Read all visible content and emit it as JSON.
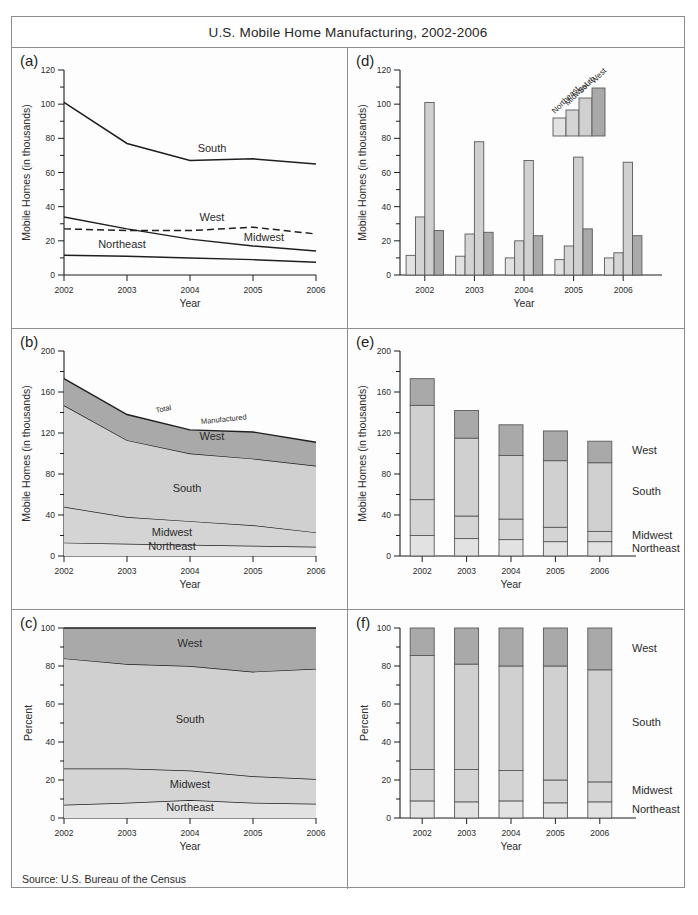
{
  "figure": {
    "title": "U.S. Mobile Home Manufacturing, 2002-2006",
    "source_note": "Source: U.S. Bureau of the Census",
    "panel_tags": [
      "(a)",
      "(d)",
      "(b)",
      "(e)",
      "(c)",
      "(f)"
    ]
  },
  "labels": {
    "year_axis": "Year",
    "homes_axis": "Mobile Homes (in thousands)",
    "percent_axis": "Percent",
    "northeast": "Northeast",
    "midwest": "Midwest",
    "south": "South",
    "west": "West",
    "total": "Total",
    "manufactured": "Manufactured"
  },
  "colors": {
    "northeast": "#e2e2e2",
    "midwest": "#d4d4d4",
    "south": "#d0d0d0",
    "west": "#a9a9a9",
    "line": "#1f1f1f",
    "frame": "#8e8e8e",
    "paper": "#fdfdfd"
  },
  "chart_data": [
    {
      "id": "panel-a",
      "panel": "(a)",
      "type": "line",
      "title": "",
      "xlabel": "Year",
      "ylabel": "Mobile Homes (in thousands)",
      "categories": [
        "2002",
        "2003",
        "2004",
        "2005",
        "2006"
      ],
      "x": [
        2002,
        2003,
        2004,
        2005,
        2006
      ],
      "ylim": [
        0,
        120
      ],
      "yticks": [
        0,
        20,
        40,
        60,
        80,
        100,
        120
      ],
      "minor_ticks": true,
      "grid": false,
      "legend": "inline-labels",
      "series": [
        {
          "name": "South",
          "values": [
            101,
            77,
            67,
            68,
            65
          ],
          "style": "solid"
        },
        {
          "name": "Midwest",
          "values": [
            34,
            27,
            21,
            17,
            14
          ],
          "style": "solid"
        },
        {
          "name": "West",
          "values": [
            27,
            26,
            26,
            28,
            24
          ],
          "style": "dashed"
        },
        {
          "name": "Northeast",
          "values": [
            11.5,
            11,
            10,
            9,
            7.5
          ],
          "style": "solid"
        }
      ]
    },
    {
      "id": "panel-d",
      "panel": "(d)",
      "type": "bar",
      "title": "",
      "xlabel": "Year",
      "ylabel": "Mobile Homes (in thousands)",
      "categories": [
        "2002",
        "2003",
        "2004",
        "2005",
        "2006"
      ],
      "ylim": [
        0,
        120
      ],
      "yticks": [
        0,
        20,
        40,
        60,
        80,
        100,
        120
      ],
      "minor_ticks": true,
      "grid": false,
      "legend": "stepped-icon",
      "legend_entries": [
        "Northeast",
        "Midwest",
        "South",
        "West"
      ],
      "series": [
        {
          "name": "Northeast",
          "values": [
            11.5,
            11,
            10,
            9,
            10
          ]
        },
        {
          "name": "Midwest",
          "values": [
            34,
            24,
            20,
            17,
            13
          ]
        },
        {
          "name": "South",
          "values": [
            101,
            78,
            67,
            69,
            66
          ]
        },
        {
          "name": "West",
          "values": [
            26,
            25,
            23,
            27,
            23
          ]
        }
      ]
    },
    {
      "id": "panel-b",
      "panel": "(b)",
      "type": "area",
      "stacked": true,
      "title": "",
      "xlabel": "Year",
      "ylabel": "Mobile Homes (in thousands)",
      "categories": [
        "2002",
        "2003",
        "2004",
        "2005",
        "2006"
      ],
      "ylim": [
        0,
        200
      ],
      "yticks": [
        0,
        40,
        80,
        120,
        160,
        200
      ],
      "minor_ticks": true,
      "grid": false,
      "annotations": [
        "Total",
        "Manufactured"
      ],
      "series": [
        {
          "name": "Northeast",
          "values": [
            13,
            12,
            11,
            10,
            9
          ]
        },
        {
          "name": "Midwest",
          "values": [
            35,
            26,
            23,
            20,
            14
          ]
        },
        {
          "name": "South",
          "values": [
            99,
            75,
            66,
            65,
            65
          ]
        },
        {
          "name": "West",
          "values": [
            26,
            25,
            23,
            26,
            23
          ]
        }
      ],
      "totals": [
        173,
        138,
        123,
        121,
        111
      ]
    },
    {
      "id": "panel-e",
      "panel": "(e)",
      "type": "bar",
      "stacked": true,
      "title": "",
      "xlabel": "Year",
      "ylabel": "Mobile Homes (in thousands)",
      "categories": [
        "2002",
        "2003",
        "2004",
        "2005",
        "2006"
      ],
      "ylim": [
        0,
        200
      ],
      "yticks": [
        0,
        40,
        80,
        120,
        160,
        200
      ],
      "minor_ticks": true,
      "grid": false,
      "legend": "right-labels",
      "series": [
        {
          "name": "Northeast",
          "values": [
            20,
            17,
            16,
            14,
            14
          ]
        },
        {
          "name": "Midwest",
          "values": [
            35,
            22,
            20,
            14,
            10
          ]
        },
        {
          "name": "South",
          "values": [
            92,
            76,
            62,
            65,
            67
          ]
        },
        {
          "name": "West",
          "values": [
            26,
            27,
            30,
            29,
            21
          ]
        }
      ],
      "totals": [
        173,
        142,
        128,
        122,
        112
      ]
    },
    {
      "id": "panel-c",
      "panel": "(c)",
      "type": "area",
      "stacked": true,
      "normalized": true,
      "title": "",
      "xlabel": "Year",
      "ylabel": "Percent",
      "categories": [
        "2002",
        "2003",
        "2004",
        "2005",
        "2006"
      ],
      "ylim": [
        0,
        100
      ],
      "yticks": [
        0,
        20,
        40,
        60,
        80,
        100
      ],
      "minor_ticks": true,
      "grid": false,
      "series": [
        {
          "name": "Northeast",
          "values": [
            7,
            8,
            9.5,
            8,
            7.5
          ]
        },
        {
          "name": "Midwest",
          "values": [
            19,
            18,
            15.5,
            14,
            13
          ]
        },
        {
          "name": "South",
          "values": [
            58,
            55,
            55,
            55,
            58
          ]
        },
        {
          "name": "West",
          "values": [
            16,
            19,
            20,
            23,
            21.5
          ]
        }
      ]
    },
    {
      "id": "panel-f",
      "panel": "(f)",
      "type": "bar",
      "stacked": true,
      "normalized": true,
      "title": "",
      "xlabel": "Year",
      "ylabel": "Percent",
      "categories": [
        "2002",
        "2003",
        "2004",
        "2005",
        "2006"
      ],
      "ylim": [
        0,
        100
      ],
      "yticks": [
        0,
        20,
        40,
        60,
        80,
        100
      ],
      "minor_ticks": true,
      "grid": false,
      "legend": "right-labels",
      "series": [
        {
          "name": "Northeast",
          "values": [
            9,
            8.5,
            9,
            8,
            8.5
          ]
        },
        {
          "name": "Midwest",
          "values": [
            16.5,
            17,
            16,
            12,
            10.5
          ]
        },
        {
          "name": "South",
          "values": [
            60,
            55.5,
            55,
            60,
            59
          ]
        },
        {
          "name": "West",
          "values": [
            14.5,
            19,
            20,
            20,
            22
          ]
        }
      ]
    }
  ]
}
